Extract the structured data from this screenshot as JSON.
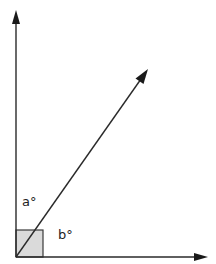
{
  "diagram": {
    "type": "angle-diagram",
    "vertex": {
      "x": 16,
      "y": 257
    },
    "rays": [
      {
        "name": "vertical-ray",
        "direction": "up",
        "end": {
          "x": 16,
          "y": 10
        }
      },
      {
        "name": "horizontal-ray",
        "direction": "right",
        "end": {
          "x": 207,
          "y": 257
        }
      },
      {
        "name": "diagonal-ray",
        "direction": "up-right",
        "end": {
          "x": 147,
          "y": 70
        }
      }
    ],
    "right_angle_marker": {
      "x": 16,
      "y": 230,
      "size": 27,
      "fill": "#d9d9d9"
    },
    "labels": {
      "angle_a": "a°",
      "angle_b": "b°"
    },
    "colors": {
      "line": "#2a2a2a",
      "background": "#ffffff",
      "marker_fill": "#d9d9d9"
    }
  }
}
